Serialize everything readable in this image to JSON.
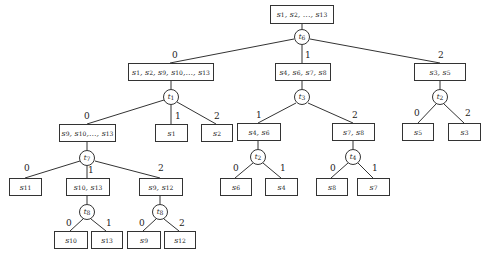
{
  "nodes": {
    "root": "s1, s2, ..., s13",
    "n0": "s1, s2, s9, s10,..., s13",
    "n1": "s4, s6, s7, s8",
    "n2": "s3, s5",
    "n00": "s9, s10,..., s13",
    "n01": "s1",
    "n02": "s2",
    "n10": "s4, s6",
    "n12": "s7, s8",
    "n20": "s5",
    "n22": "s3",
    "n000": "s11",
    "n001": "s10, s13",
    "n002": "s9, s12",
    "n100": "s6",
    "n101": "s4",
    "n120": "s8",
    "n121": "s7",
    "n0010": "s10",
    "n0011": "s13",
    "n0020": "s9",
    "n0022": "s12"
  },
  "tests": {
    "troot": "t6",
    "t0": "t1",
    "t1": "t3",
    "t2": "t2",
    "t00": "t7",
    "t10": "t2",
    "t12": "t4",
    "t001": "t8",
    "t002": "t8"
  },
  "edges": {
    "e_root_0": "0",
    "e_root_1": "1",
    "e_root_2": "2",
    "e_0_0": "0",
    "e_0_1": "1",
    "e_0_2": "2",
    "e_1_1": "1",
    "e_1_2": "2",
    "e_2_0": "0",
    "e_2_2": "2",
    "e_00_0": "0",
    "e_00_1": "1",
    "e_00_2": "2",
    "e_10_0": "0",
    "e_10_1": "1",
    "e_12_0": "0",
    "e_12_1": "1",
    "e_001_0": "0",
    "e_001_1": "1",
    "e_002_0": "0",
    "e_002_2": "2"
  }
}
